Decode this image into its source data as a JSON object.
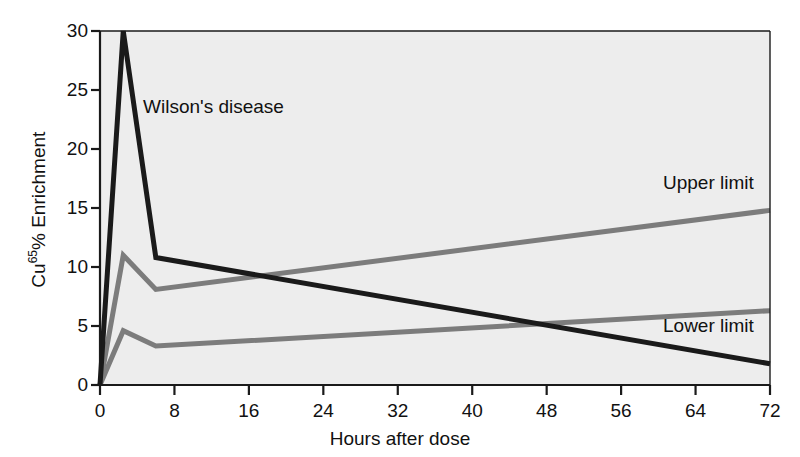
{
  "figure": {
    "background_color": "#ffffff",
    "plot_background_color": "#ededed",
    "axis_color": "#1a1a1a"
  },
  "chart_data": {
    "type": "line",
    "title": "",
    "xlabel": "Hours after dose",
    "ylabel": "Cu65% Enrichment",
    "ylabel_base": "Cu",
    "ylabel_superscript": "65",
    "ylabel_rest": "% Enrichment",
    "xlim": [
      0,
      72
    ],
    "ylim": [
      0,
      30
    ],
    "xticks": [
      0,
      8,
      16,
      24,
      32,
      40,
      48,
      56,
      64,
      72
    ],
    "xtick_labels": [
      "0",
      "8",
      "16",
      "24",
      "32",
      "40",
      "48",
      "56",
      "64",
      "72"
    ],
    "yticks": [
      0,
      5,
      10,
      15,
      20,
      25,
      30
    ],
    "ytick_labels": [
      "0",
      "5",
      "10",
      "15",
      "20",
      "25",
      "30"
    ],
    "grid": false,
    "legend_position": "inline-annotations",
    "series": [
      {
        "name": "Wilson's disease",
        "color": "#1a1a1a",
        "line_width": 5,
        "x": [
          0,
          2.5,
          6,
          72
        ],
        "values": [
          0,
          30,
          10.8,
          1.8
        ]
      },
      {
        "name": "Upper limit",
        "color": "#7c7c7c",
        "line_width": 5,
        "x": [
          0,
          2.5,
          6,
          72
        ],
        "values": [
          0,
          11.0,
          8.1,
          14.8
        ]
      },
      {
        "name": "Lower limit",
        "color": "#7c7c7c",
        "line_width": 5,
        "x": [
          0,
          2.5,
          6,
          72
        ],
        "values": [
          0,
          4.6,
          3.3,
          6.3
        ]
      }
    ],
    "annotations": [
      {
        "text": "Wilson's disease",
        "x": 5.0,
        "y": 23.2
      },
      {
        "text": "Upper limit",
        "x": 61.0,
        "y": 16.8
      },
      {
        "text": "Lower limit",
        "x": 61.0,
        "y": 4.6
      }
    ]
  }
}
